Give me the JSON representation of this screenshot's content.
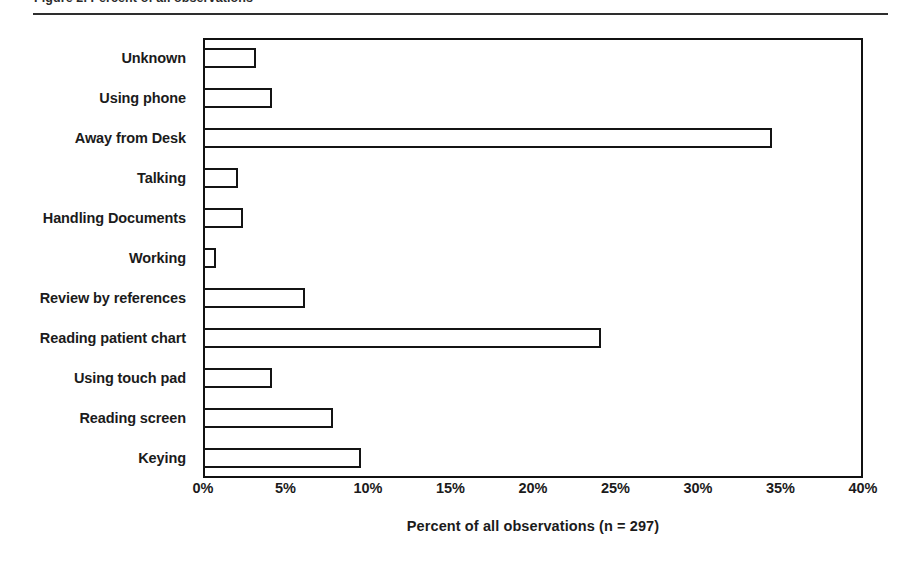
{
  "figure": {
    "clipped_caption": "Figure 2.  Percent of all observations",
    "rule_color": "#2e2e2e"
  },
  "chart_data": {
    "type": "bar",
    "orientation": "horizontal",
    "title": "",
    "subtitle": "",
    "xlabel": "Percent of all observations (n = 297)",
    "ylabel": "",
    "categories": [
      "Unknown",
      "Using phone",
      "Away from Desk",
      "Talking",
      "Handling Documents",
      "Working",
      "Review by references",
      "Reading patient chart",
      "Using touch pad",
      "Reading screen",
      "Keying"
    ],
    "values": [
      3.2,
      4.2,
      34.5,
      2.1,
      2.4,
      0.8,
      6.2,
      24.1,
      4.2,
      7.9,
      9.6
    ],
    "xlim": [
      0,
      40
    ],
    "xtick_values": [
      0,
      5,
      10,
      15,
      20,
      25,
      30,
      35,
      40
    ],
    "xtick_labels": [
      "0%",
      "5%",
      "10%",
      "15%",
      "20%",
      "25%",
      "30%",
      "35%",
      "40%"
    ],
    "grid": false,
    "legend": false,
    "legend_position": "none",
    "bar_fill": "#ffffff",
    "bar_edge": "#141414",
    "n": 297
  }
}
